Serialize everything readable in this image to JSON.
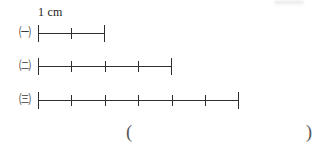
{
  "worksheet": {
    "unit_label": "1 cm",
    "background_color": "#ffffff",
    "line_color": "#2e2e2e",
    "unit_px": 33.5,
    "rows": [
      {
        "marker": "㈠",
        "marker_name": "circled-korean-giyeok",
        "segments": 2,
        "length_cm": "2",
        "start_x": 38,
        "end_x": 105
      },
      {
        "marker": "㈡",
        "marker_name": "circled-korean-nieun",
        "segments": 4,
        "length_cm": "4",
        "start_x": 38,
        "end_x": 172
      },
      {
        "marker": "㈢",
        "marker_name": "circled-korean-digeut",
        "segments": 6,
        "length_cm": "6",
        "start_x": 38,
        "end_x": 239
      }
    ],
    "answer": {
      "open_paren": "(",
      "close_paren": ")",
      "value": ""
    }
  }
}
